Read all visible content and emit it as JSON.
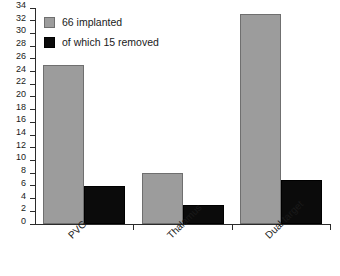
{
  "chart_data": {
    "type": "bar",
    "title": "",
    "xlabel": "",
    "ylabel": "",
    "categories": [
      "PVG",
      "Thalamus",
      "Dual target"
    ],
    "series": [
      {
        "name": "66 implanted",
        "color": "#9c9c9c",
        "values": [
          25,
          8,
          33
        ]
      },
      {
        "name": "of which 15 removed",
        "color": "#0b0b0b",
        "values": [
          6,
          3,
          7
        ]
      }
    ],
    "ylim": [
      0,
      34
    ],
    "ytick_step": 2,
    "yticks": [
      0,
      2,
      4,
      6,
      8,
      10,
      12,
      14,
      16,
      18,
      20,
      22,
      24,
      26,
      28,
      30,
      32,
      34
    ],
    "ytick_labels": [
      "0",
      "2",
      "4",
      "6",
      "8",
      "10",
      "12",
      "14",
      "16",
      "18",
      "20",
      "22",
      "24",
      "26",
      "28",
      "30",
      "32",
      "34"
    ],
    "grid": false,
    "legend_position": "top-left",
    "xlabel_rotation": -45
  },
  "legend": {
    "entries": [
      {
        "label": "66 implanted",
        "swatch": "gray"
      },
      {
        "label": "of which 15 removed",
        "swatch": "black"
      }
    ]
  },
  "colors": {
    "series_gray": "#9c9c9c",
    "series_black": "#0b0b0b",
    "axis": "#2b2b2b",
    "background": "#ffffff"
  }
}
